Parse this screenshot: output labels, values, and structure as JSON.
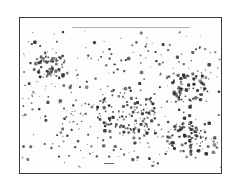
{
  "image": {
    "description": "Scanned photograph of a speckled dot field within a thin dark rectangular frame",
    "background_color": "#ffffff",
    "frame_color": "#3a3a3a",
    "dot_color": "#2e2e2e",
    "frame": {
      "x": 19,
      "y": 17,
      "width": 203,
      "height": 157
    },
    "dot_field": {
      "region": {
        "x": 22,
        "y": 30,
        "width": 198,
        "height": 138
      },
      "dense_clusters": [
        {
          "x": 50,
          "y": 65,
          "r": 18
        },
        {
          "x": 190,
          "y": 85,
          "r": 20
        },
        {
          "x": 185,
          "y": 135,
          "r": 20
        },
        {
          "x": 125,
          "y": 110,
          "r": 30
        }
      ],
      "approx_dot_count": 700,
      "seed": 7
    }
  }
}
